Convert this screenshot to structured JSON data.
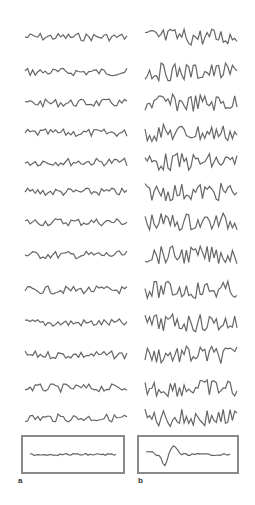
{
  "figure": {
    "panel_labels": [
      "a",
      "b"
    ],
    "trace_color": "#666666",
    "box_color": "#8a8a8a",
    "columns": [
      {
        "label": "a",
        "x_start": 25,
        "x_end": 127,
        "amplitude": 4,
        "rows": 13,
        "average": "flat"
      },
      {
        "label": "b",
        "x_start": 145,
        "x_end": 237,
        "amplitude": 9,
        "rows": 13,
        "average": "evoked"
      }
    ],
    "row_y": [
      37,
      72,
      103,
      133,
      162,
      192,
      222,
      255,
      290,
      323,
      355,
      388,
      418
    ],
    "boxes": [
      {
        "label": "a",
        "x": 22,
        "y": 436,
        "w": 102,
        "h": 37
      },
      {
        "label": "b",
        "x": 138,
        "y": 436,
        "w": 100,
        "h": 37
      }
    ]
  }
}
